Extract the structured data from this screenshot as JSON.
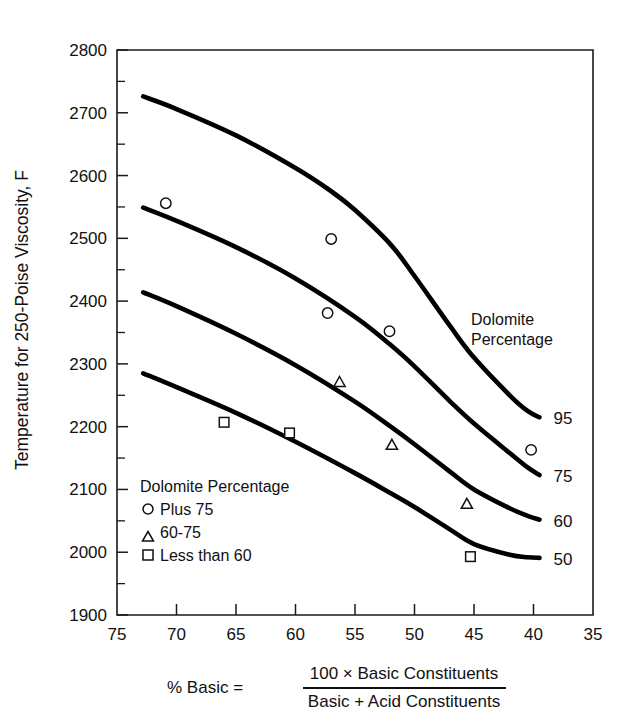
{
  "chart_data": {
    "type": "line",
    "title": "",
    "xlabel": "% Basic",
    "ylabel": "Temperature for 250-Poise Viscosity, F",
    "xlim": [
      75,
      35
    ],
    "ylim": [
      1900,
      2800
    ],
    "x_ticks": [
      75,
      70,
      65,
      60,
      55,
      50,
      45,
      40,
      35
    ],
    "y_ticks": [
      1900,
      2000,
      2100,
      2200,
      2300,
      2400,
      2500,
      2600,
      2700,
      2800
    ],
    "y_minor_step": 50,
    "x_axis_reversed": true,
    "grid": false,
    "legend_position": "inside-lower-left",
    "series": [
      {
        "name": "95",
        "label": "95",
        "points": [
          {
            "x": 72.8,
            "y": 2726
          },
          {
            "x": 70.0,
            "y": 2706
          },
          {
            "x": 65.0,
            "y": 2664
          },
          {
            "x": 60.0,
            "y": 2612
          },
          {
            "x": 57.0,
            "y": 2575
          },
          {
            "x": 55.0,
            "y": 2545
          },
          {
            "x": 52.0,
            "y": 2490
          },
          {
            "x": 50.0,
            "y": 2440
          },
          {
            "x": 47.0,
            "y": 2360
          },
          {
            "x": 45.0,
            "y": 2310
          },
          {
            "x": 42.0,
            "y": 2250
          },
          {
            "x": 40.5,
            "y": 2225
          },
          {
            "x": 39.5,
            "y": 2215
          }
        ]
      },
      {
        "name": "75",
        "label": "75",
        "points": [
          {
            "x": 72.8,
            "y": 2549
          },
          {
            "x": 70.0,
            "y": 2528
          },
          {
            "x": 65.0,
            "y": 2486
          },
          {
            "x": 60.0,
            "y": 2436
          },
          {
            "x": 55.0,
            "y": 2375
          },
          {
            "x": 52.0,
            "y": 2330
          },
          {
            "x": 50.0,
            "y": 2296
          },
          {
            "x": 47.0,
            "y": 2240
          },
          {
            "x": 45.0,
            "y": 2205
          },
          {
            "x": 42.0,
            "y": 2158
          },
          {
            "x": 40.5,
            "y": 2135
          },
          {
            "x": 39.5,
            "y": 2123
          }
        ]
      },
      {
        "name": "60",
        "label": "60",
        "points": [
          {
            "x": 72.8,
            "y": 2414
          },
          {
            "x": 70.0,
            "y": 2392
          },
          {
            "x": 65.0,
            "y": 2348
          },
          {
            "x": 60.0,
            "y": 2298
          },
          {
            "x": 55.0,
            "y": 2240
          },
          {
            "x": 52.0,
            "y": 2200
          },
          {
            "x": 50.0,
            "y": 2172
          },
          {
            "x": 47.0,
            "y": 2128
          },
          {
            "x": 45.0,
            "y": 2100
          },
          {
            "x": 42.0,
            "y": 2070
          },
          {
            "x": 40.5,
            "y": 2058
          },
          {
            "x": 39.5,
            "y": 2052
          }
        ]
      },
      {
        "name": "50",
        "label": "50",
        "points": [
          {
            "x": 72.8,
            "y": 2285
          },
          {
            "x": 70.0,
            "y": 2263
          },
          {
            "x": 65.0,
            "y": 2222
          },
          {
            "x": 60.0,
            "y": 2176
          },
          {
            "x": 55.0,
            "y": 2126
          },
          {
            "x": 52.0,
            "y": 2094
          },
          {
            "x": 50.0,
            "y": 2072
          },
          {
            "x": 47.0,
            "y": 2036
          },
          {
            "x": 45.0,
            "y": 2013
          },
          {
            "x": 42.0,
            "y": 1996
          },
          {
            "x": 40.5,
            "y": 1992
          },
          {
            "x": 39.5,
            "y": 1991
          }
        ]
      }
    ],
    "scatter_groups": [
      {
        "name": "Plus 75",
        "marker": "circle",
        "points": [
          {
            "x": 70.9,
            "y": 2556
          },
          {
            "x": 57.0,
            "y": 2499
          },
          {
            "x": 57.3,
            "y": 2381
          },
          {
            "x": 52.1,
            "y": 2352
          },
          {
            "x": 40.2,
            "y": 2163
          }
        ]
      },
      {
        "name": "60-75",
        "marker": "triangle",
        "points": [
          {
            "x": 56.3,
            "y": 2271
          },
          {
            "x": 51.9,
            "y": 2171
          },
          {
            "x": 45.6,
            "y": 2077
          }
        ]
      },
      {
        "name": "Less than 60",
        "marker": "square",
        "points": [
          {
            "x": 66.0,
            "y": 2207
          },
          {
            "x": 60.5,
            "y": 2190
          },
          {
            "x": 45.3,
            "y": 1993
          }
        ]
      }
    ],
    "annotations": {
      "curve_group_title_line1": "Dolomite",
      "curve_group_title_line2": "Percentage"
    }
  },
  "legend": {
    "title": "Dolomite Percentage",
    "entries": [
      {
        "marker": "circle",
        "label": "Plus 75"
      },
      {
        "marker": "triangle",
        "label": "60-75"
      },
      {
        "marker": "square",
        "label": "Less than 60"
      }
    ]
  },
  "equation": {
    "lhs": "% Basic =",
    "numerator": "100 × Basic Constituents",
    "denominator": "Basic + Acid Constituents"
  },
  "axes": {
    "y_title": "Temperature  for 250-Poise  Viscosity, F",
    "y_tick_labels": [
      "2800",
      "2700",
      "2600",
      "2500",
      "2400",
      "2300",
      "2200",
      "2100",
      "2000",
      "1900"
    ],
    "x_tick_labels": [
      "75",
      "70",
      "65",
      "60",
      "55",
      "50",
      "45",
      "40",
      "35"
    ]
  },
  "colors": {
    "ink": "#111111",
    "curve": "#000000",
    "background": "#ffffff"
  }
}
